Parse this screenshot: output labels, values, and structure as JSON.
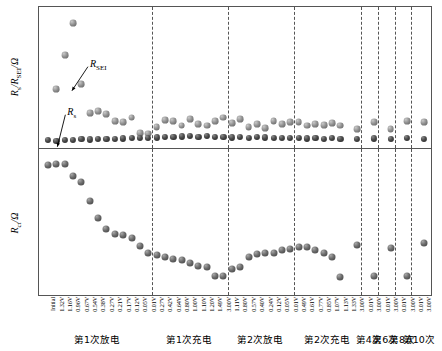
{
  "chart_data": {
    "type": "scatter",
    "title": "",
    "panels": [
      {
        "id": "top",
        "ylabel": "Rs/RSEI/Ω",
        "ylabel_parts": [
          "R",
          "s",
          "/R",
          "SEI",
          "/Ω"
        ],
        "ylim": [
          0,
          88
        ],
        "yticks": [
          0,
          20,
          40,
          60,
          80
        ],
        "ytick_labels": [
          "0",
          "20",
          "40",
          "60",
          "80"
        ],
        "grid": false,
        "annotations": [
          {
            "text": "RSEI",
            "base": "R",
            "sub": "SEI",
            "x_index": 4.3,
            "y_value": 52
          },
          {
            "text": "Rs",
            "base": "R",
            "sub": "s",
            "x_index": 1.6,
            "y_value": 22
          }
        ],
        "series": [
          {
            "name": "R_SEI",
            "marker": "light-sphere",
            "values": [
              null,
              37,
              58,
              78,
              40,
              22,
              23,
              21,
              17,
              16,
              19,
              9.5,
              9,
              13,
              17.5,
              17,
              14,
              18,
              15,
              14,
              17,
              19,
              15.5,
              18,
              13,
              15,
              12.5,
              17,
              15,
              16,
              16,
              14,
              15,
              14.5,
              15.5,
              14,
              null,
              12,
              null,
              16,
              null,
              12,
              null,
              17,
              null,
              16,
              null,
              17,
              null,
              11,
              null,
              16
            ]
          },
          {
            "name": "R_s",
            "marker": "dark-sphere",
            "values": [
              5,
              4.6,
              5.3,
              5.2,
              5.5,
              5.4,
              5.6,
              5.8,
              5.9,
              6.0,
              6.1,
              6.3,
              6.5,
              6.6,
              6.8,
              7.0,
              7.2,
              7.4,
              7.0,
              7.3,
              6.9,
              7.0,
              6.6,
              6.7,
              6.4,
              6.8,
              6.6,
              6.4,
              6.5,
              6.2,
              6.3,
              6.0,
              6.2,
              5.9,
              6.1,
              5.7,
              null,
              5.5,
              null,
              6.0,
              null,
              5.6,
              null,
              6.1,
              null,
              5.7,
              null,
              6.2,
              null,
              5.5,
              null,
              5.9
            ]
          }
        ]
      },
      {
        "id": "bottom",
        "ylabel": "Rct/Ω",
        "ylabel_parts": [
          "R",
          "ct",
          "/Ω"
        ],
        "ylim": [
          0,
          620
        ],
        "yticks": [
          0,
          100,
          200,
          300,
          400,
          500,
          600
        ],
        "ytick_labels": [
          "0",
          "100",
          "200",
          "300",
          "400",
          "500",
          "600"
        ],
        "grid": false,
        "series": [
          {
            "name": "R_ct",
            "marker": "gray-sphere",
            "values": [
              552,
              556,
              558,
              505,
              480,
              400,
              328,
              282,
              260,
              256,
              244,
              210,
              178,
              170,
              163,
              155,
              148,
              138,
              122,
              118,
              82,
              80,
              112,
              120,
              162,
              172,
              177,
              180,
              190,
              196,
              202,
              205,
              190,
              178,
              160,
              78,
              null,
              212,
              null,
              80,
              null,
              198,
              null,
              80,
              null,
              220,
              null,
              92,
              null,
              90,
              null,
              218
            ]
          }
        ]
      }
    ],
    "x_tick_labels": [
      "Initial",
      "1.32V",
      "1.16V",
      "0.96V",
      "0.67V",
      "0.54V",
      "0.38V",
      "0.27V",
      "0.21V",
      "0.17V",
      "0.12V",
      "0.05V",
      "0.01V",
      "0.27V",
      "0.42V",
      "0.64V",
      "0.80V",
      "1.00V",
      "1.10V",
      "1.20V",
      "1.49V",
      "3.00V",
      "1.11V",
      "0.80V",
      "0.57V",
      "0.40V",
      "0.24V",
      "0.12V",
      "0.05V",
      "0.01V",
      "0.49V",
      "0.61V",
      "0.77V",
      "0.85V",
      "1.07V",
      "1.13V",
      "1.33V",
      "3.00V",
      "0.01V",
      "3.00V",
      "0.01V",
      "3.00V",
      "0.01V",
      "3.00V",
      "0.01V",
      "3.00V"
    ],
    "groups": [
      {
        "label": "第1次放电",
        "start_index": 0,
        "end_index": 12
      },
      {
        "label": "第1次充电",
        "start_index": 13,
        "end_index": 21
      },
      {
        "label": "第2次放电",
        "start_index": 22,
        "end_index": 29
      },
      {
        "label": "第2次充电",
        "start_index": 30,
        "end_index": 37
      },
      {
        "label": "第4次",
        "start_index": 38,
        "end_index": 39
      },
      {
        "label": "第6次",
        "start_index": 40,
        "end_index": 41
      },
      {
        "label": "第8次",
        "start_index": 42,
        "end_index": 43
      },
      {
        "label": "第10次",
        "start_index": 44,
        "end_index": 45
      }
    ],
    "colors": {
      "axis": "#555555",
      "divider": "#555555",
      "marker_dark": "#2a2a2a",
      "marker_light": "#8e8e8e",
      "marker_ct": "#5a5a5a",
      "background": "#ffffff"
    }
  }
}
